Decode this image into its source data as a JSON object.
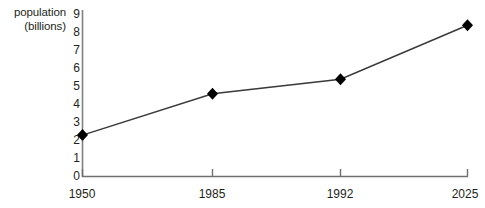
{
  "chart_data": {
    "type": "line",
    "title": "",
    "xlabel": "",
    "ylabel": "population (billions)",
    "ylabel_lines": [
      "population",
      "(billions)"
    ],
    "x": [
      1950,
      1985,
      1992,
      2025
    ],
    "categories": [
      "1950",
      "1985",
      "1992",
      "2025"
    ],
    "values": [
      2.3,
      4.6,
      5.4,
      8.4
    ],
    "series": [
      {
        "name": "world population",
        "values": [
          2.3,
          4.6,
          5.4,
          8.4
        ]
      }
    ],
    "ylim": [
      0,
      9
    ],
    "yticks": [
      0,
      1,
      2,
      3,
      4,
      5,
      6,
      7,
      8,
      9
    ],
    "ytick_labels": [
      "0",
      "1",
      "2",
      "3",
      "4",
      "5",
      "6",
      "7",
      "8",
      "9"
    ],
    "xtick_labels": [
      "1950",
      "1985",
      "1992",
      "2025"
    ],
    "grid": false,
    "legend": "none",
    "marker": "diamond",
    "line_color": "#3a3a3a",
    "marker_color": "#000000",
    "axis_color": "#808080",
    "text_color": "#231f20",
    "background": "#ffffff"
  }
}
